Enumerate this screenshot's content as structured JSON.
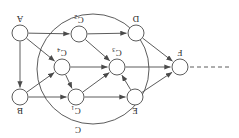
{
  "figure": {
    "type": "directed-graph",
    "orientation_deg": 180,
    "background": "#ffffff",
    "stroke_color": "#4a4a4a",
    "node_fill": "#ffffff",
    "label_color": "#262626",
    "cluster": {
      "label": "C",
      "shape": "ellipse",
      "cx": 146,
      "cy": 69,
      "rx": 56,
      "ry": 55,
      "label_x": 161,
      "label_y": 11
    },
    "nodes": [
      {
        "id": "F",
        "label": "F",
        "sub": "",
        "x": 59,
        "y": 71,
        "r": 8,
        "label_dx": 0,
        "label_dy": 17
      },
      {
        "id": "E",
        "label": "E",
        "sub": "",
        "x": 104,
        "y": 41,
        "r": 8,
        "label_dx": 0,
        "label_dy": -11
      },
      {
        "id": "D",
        "label": "D",
        "sub": "",
        "x": 103,
        "y": 105,
        "r": 8,
        "label_dx": 0,
        "label_dy": 17
      },
      {
        "id": "C1",
        "label": "C",
        "sub": "1",
        "x": 163,
        "y": 41,
        "r": 8,
        "label_dx": 0,
        "label_dy": -11
      },
      {
        "id": "C2",
        "label": "C",
        "sub": "2",
        "x": 160,
        "y": 104,
        "r": 8,
        "label_dx": 0,
        "label_dy": 17
      },
      {
        "id": "C3",
        "label": "C",
        "sub": "3",
        "x": 122,
        "y": 71,
        "r": 8,
        "label_dx": 0,
        "label_dy": 17
      },
      {
        "id": "C4",
        "label": "C",
        "sub": "4",
        "x": 177,
        "y": 71,
        "r": 8,
        "label_dx": 0,
        "label_dy": 17
      },
      {
        "id": "B",
        "label": "B",
        "sub": "",
        "x": 219,
        "y": 41,
        "r": 8,
        "label_dx": 0,
        "label_dy": -11
      },
      {
        "id": "A",
        "label": "A",
        "sub": "",
        "x": 219,
        "y": 105,
        "r": 8,
        "label_dx": 0,
        "label_dy": 17
      }
    ],
    "edges": [
      {
        "from": "E",
        "to": "F",
        "kind": "solid"
      },
      {
        "from": "D",
        "to": "F",
        "kind": "solid"
      },
      {
        "from": "C3",
        "to": "F",
        "kind": "solid"
      },
      {
        "from": "C1",
        "to": "E",
        "kind": "solid"
      },
      {
        "from": "E",
        "to": "C3",
        "kind": "solid"
      },
      {
        "from": "C1",
        "to": "C3",
        "kind": "solid"
      },
      {
        "from": "C4",
        "to": "C3",
        "kind": "solid"
      },
      {
        "from": "C2",
        "to": "C3",
        "kind": "solid"
      },
      {
        "from": "C4",
        "to": "C1",
        "kind": "solid"
      },
      {
        "from": "B",
        "to": "C1",
        "kind": "solid"
      },
      {
        "from": "A",
        "to": "C4",
        "kind": "solid"
      },
      {
        "from": "A",
        "to": "C2",
        "kind": "solid"
      },
      {
        "from": "A",
        "to": "B",
        "kind": "solid"
      },
      {
        "from": "C2",
        "to": "D",
        "kind": "solid"
      },
      {
        "from": "B",
        "to": "C4",
        "kind": "solid"
      }
    ],
    "open_edge": {
      "id": "dangling-dashed-edge",
      "kind": "dashed",
      "from_x": 10,
      "to_x": 51,
      "y": 71
    }
  }
}
